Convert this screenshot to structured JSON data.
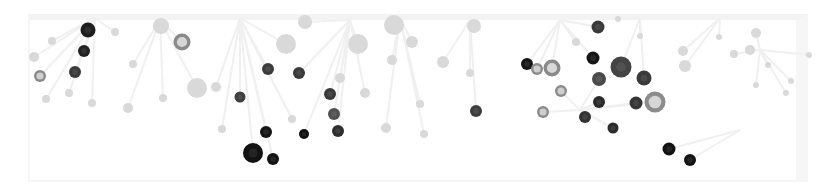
{
  "graphic": {
    "kind": "decorative-network-bubbles",
    "background": "#ffffff",
    "edge_color": "#f0f0f0",
    "palette": {
      "black": "#161616",
      "dark": "#2e2e2e",
      "darkgray": "#474747",
      "midgray": "#8c8c8c",
      "light": "#d9d9d9",
      "faint": "#e6e6e6"
    },
    "hubs": [
      {
        "x": 95,
        "y": 18
      },
      {
        "x": 160,
        "y": 20
      },
      {
        "x": 240,
        "y": 18
      },
      {
        "x": 350,
        "y": 20
      },
      {
        "x": 400,
        "y": 18
      },
      {
        "x": 470,
        "y": 20
      },
      {
        "x": 560,
        "y": 20
      },
      {
        "x": 640,
        "y": 18
      },
      {
        "x": 720,
        "y": 18
      },
      {
        "x": 760,
        "y": 50
      },
      {
        "x": 740,
        "y": 130
      },
      {
        "x": 580,
        "y": 110
      }
    ],
    "nodes": [
      {
        "x": 88,
        "y": 30,
        "r": 7.5,
        "fill": "#1e1e1e",
        "ring": null
      },
      {
        "x": 84,
        "y": 51,
        "r": 6,
        "fill": "#222222",
        "ring": null
      },
      {
        "x": 75,
        "y": 72,
        "r": 6,
        "fill": "#3a3a3a",
        "ring": null
      },
      {
        "x": 40,
        "y": 76,
        "r": 6,
        "fill": "#8a8a8a",
        "ring": "#d0d0d0"
      },
      {
        "x": 182,
        "y": 42,
        "r": 8.5,
        "fill": "#8a8a8a",
        "ring": "#d6d6d6"
      },
      {
        "x": 268,
        "y": 69,
        "r": 6,
        "fill": "#3c3c3c",
        "ring": null
      },
      {
        "x": 240,
        "y": 97,
        "r": 5.5,
        "fill": "#3f3f3f",
        "ring": null
      },
      {
        "x": 299,
        "y": 73,
        "r": 6,
        "fill": "#3a3a3a",
        "ring": null
      },
      {
        "x": 330,
        "y": 94,
        "r": 6,
        "fill": "#3a3a3a",
        "ring": null
      },
      {
        "x": 334,
        "y": 114,
        "r": 6,
        "fill": "#505050",
        "ring": null
      },
      {
        "x": 338,
        "y": 131,
        "r": 6,
        "fill": "#2e2e2e",
        "ring": null
      },
      {
        "x": 304,
        "y": 134,
        "r": 5,
        "fill": "#111111",
        "ring": null
      },
      {
        "x": 266,
        "y": 132,
        "r": 6,
        "fill": "#151515",
        "ring": null
      },
      {
        "x": 253,
        "y": 153,
        "r": 10,
        "fill": "#121212",
        "ring": null
      },
      {
        "x": 273,
        "y": 159,
        "r": 6,
        "fill": "#141414",
        "ring": null
      },
      {
        "x": 476,
        "y": 111,
        "r": 6,
        "fill": "#3e3e3e",
        "ring": null
      },
      {
        "x": 527,
        "y": 64,
        "r": 6,
        "fill": "#161616",
        "ring": null
      },
      {
        "x": 537,
        "y": 69,
        "r": 6,
        "fill": "#8c8c8c",
        "ring": "#cfcfcf"
      },
      {
        "x": 552,
        "y": 68,
        "r": 8.5,
        "fill": "#8a8a8a",
        "ring": "#d8d8d8"
      },
      {
        "x": 561,
        "y": 91,
        "r": 6,
        "fill": "#8c8c8c",
        "ring": "#cfcfcf"
      },
      {
        "x": 543,
        "y": 112,
        "r": 6,
        "fill": "#8c8c8c",
        "ring": "#cfcfcf"
      },
      {
        "x": 598,
        "y": 27,
        "r": 6.5,
        "fill": "#3a3a3a",
        "ring": null
      },
      {
        "x": 593,
        "y": 58,
        "r": 6.5,
        "fill": "#151515",
        "ring": null
      },
      {
        "x": 621,
        "y": 67,
        "r": 10.5,
        "fill": "#444444",
        "ring": null
      },
      {
        "x": 599,
        "y": 79,
        "r": 7,
        "fill": "#4a4a4a",
        "ring": null
      },
      {
        "x": 644,
        "y": 78,
        "r": 7.5,
        "fill": "#3a3a3a",
        "ring": null
      },
      {
        "x": 599,
        "y": 102,
        "r": 6,
        "fill": "#2a2a2a",
        "ring": null
      },
      {
        "x": 636,
        "y": 103,
        "r": 6.5,
        "fill": "#353535",
        "ring": null
      },
      {
        "x": 655,
        "y": 102,
        "r": 10.5,
        "fill": "#8c8c8c",
        "ring": "#d6d6d6"
      },
      {
        "x": 585,
        "y": 117,
        "r": 6,
        "fill": "#333333",
        "ring": null
      },
      {
        "x": 613,
        "y": 128,
        "r": 5.5,
        "fill": "#2c2c2c",
        "ring": null
      },
      {
        "x": 669,
        "y": 149,
        "r": 6.5,
        "fill": "#121212",
        "ring": null
      },
      {
        "x": 690,
        "y": 160,
        "r": 6,
        "fill": "#141414",
        "ring": null
      }
    ],
    "light_nodes": [
      {
        "x": 161,
        "y": 26,
        "r": 8
      },
      {
        "x": 358,
        "y": 44,
        "r": 10
      },
      {
        "x": 394,
        "y": 25,
        "r": 10
      },
      {
        "x": 197,
        "y": 88,
        "r": 10
      },
      {
        "x": 305,
        "y": 22,
        "r": 7
      },
      {
        "x": 286,
        "y": 44,
        "r": 10
      },
      {
        "x": 412,
        "y": 42,
        "r": 6
      },
      {
        "x": 474,
        "y": 26,
        "r": 7
      },
      {
        "x": 443,
        "y": 62,
        "r": 6
      },
      {
        "x": 34,
        "y": 57,
        "r": 5
      },
      {
        "x": 133,
        "y": 64,
        "r": 4
      },
      {
        "x": 115,
        "y": 32,
        "r": 4
      },
      {
        "x": 52,
        "y": 41,
        "r": 4
      },
      {
        "x": 216,
        "y": 87,
        "r": 5
      },
      {
        "x": 340,
        "y": 78,
        "r": 5
      },
      {
        "x": 365,
        "y": 93,
        "r": 5
      },
      {
        "x": 392,
        "y": 60,
        "r": 5
      },
      {
        "x": 470,
        "y": 73,
        "r": 4
      },
      {
        "x": 128,
        "y": 108,
        "r": 5
      },
      {
        "x": 163,
        "y": 98,
        "r": 4
      },
      {
        "x": 222,
        "y": 129,
        "r": 4
      },
      {
        "x": 292,
        "y": 119,
        "r": 4
      },
      {
        "x": 424,
        "y": 134,
        "r": 4
      },
      {
        "x": 46,
        "y": 99,
        "r": 4
      },
      {
        "x": 69,
        "y": 93,
        "r": 4
      },
      {
        "x": 92,
        "y": 103,
        "r": 4
      },
      {
        "x": 386,
        "y": 128,
        "r": 5
      },
      {
        "x": 420,
        "y": 104,
        "r": 4
      },
      {
        "x": 750,
        "y": 50,
        "r": 5
      },
      {
        "x": 756,
        "y": 33,
        "r": 5
      },
      {
        "x": 734,
        "y": 54,
        "r": 4
      },
      {
        "x": 685,
        "y": 66,
        "r": 6
      },
      {
        "x": 809,
        "y": 55,
        "r": 3
      },
      {
        "x": 768,
        "y": 65,
        "r": 3
      },
      {
        "x": 756,
        "y": 85,
        "r": 3
      },
      {
        "x": 791,
        "y": 81,
        "r": 3
      },
      {
        "x": 786,
        "y": 93,
        "r": 3
      },
      {
        "x": 719,
        "y": 37,
        "r": 3
      },
      {
        "x": 576,
        "y": 42,
        "r": 4
      },
      {
        "x": 640,
        "y": 36,
        "r": 3
      },
      {
        "x": 683,
        "y": 51,
        "r": 5
      },
      {
        "x": 618,
        "y": 19,
        "r": 3
      }
    ]
  }
}
